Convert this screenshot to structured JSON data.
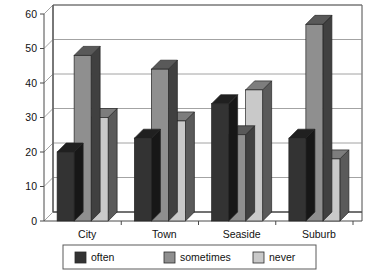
{
  "chart_data": {
    "type": "bar",
    "title": "",
    "subtitle": "",
    "xlabel": "",
    "ylabel": "",
    "categories": [
      "City",
      "Town",
      "Seaside",
      "Suburb"
    ],
    "series": [
      {
        "name": "often",
        "values": [
          20,
          24,
          34,
          24
        ],
        "color": "#333333"
      },
      {
        "name": "sometimes",
        "values": [
          48,
          44,
          25,
          57
        ],
        "color": "#8f8f8f"
      },
      {
        "name": "never",
        "values": [
          30,
          29,
          38,
          18
        ],
        "color": "#c9c9c9"
      }
    ],
    "ylim": [
      0,
      60
    ],
    "yticks": [
      0,
      10,
      20,
      30,
      40,
      50,
      60
    ],
    "ytick_labels": [
      "0",
      "10",
      "20",
      "30",
      "40",
      "50",
      "60"
    ],
    "grid": true,
    "grid_axis": "y",
    "legend_position": "bottom",
    "style": "3d-grouped-bar",
    "background": "#ffffff"
  },
  "legend": {
    "items": [
      {
        "label": "often",
        "color": "#333333"
      },
      {
        "label": "sometimes",
        "color": "#8f8f8f"
      },
      {
        "label": "never",
        "color": "#c9c9c9"
      }
    ]
  },
  "axes": {
    "y_tick_labels": [
      "60",
      "50",
      "40",
      "30",
      "20",
      "10",
      "0"
    ],
    "x_tick_labels": [
      "City",
      "Town",
      "Seaside",
      "Suburb"
    ]
  },
  "colors": {
    "series_often": "#333333",
    "series_sometimes": "#8f8f8f",
    "series_never": "#c9c9c9",
    "side_shade": "#2b2b2b",
    "grid": "#8c8c8c",
    "axis": "#4a4a4a",
    "background": "#ffffff",
    "text": "#111111"
  }
}
